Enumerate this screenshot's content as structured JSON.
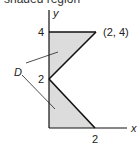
{
  "caption_partial": "shaded region",
  "diagram": {
    "axes": {
      "x_label": "x",
      "y_label": "y"
    },
    "ticks": {
      "y_4": "4",
      "y_2": "2",
      "x_2": "2"
    },
    "point_label": "(2, 4)",
    "region_label": "D",
    "fill_color": "#dcdcdc",
    "line_color": "#111111",
    "regions": [
      {
        "vertices": [
          [
            0,
            4
          ],
          [
            2,
            4
          ],
          [
            0,
            2
          ]
        ]
      },
      {
        "vertices": [
          [
            0,
            2
          ],
          [
            2,
            0
          ],
          [
            0,
            0
          ]
        ]
      }
    ]
  }
}
